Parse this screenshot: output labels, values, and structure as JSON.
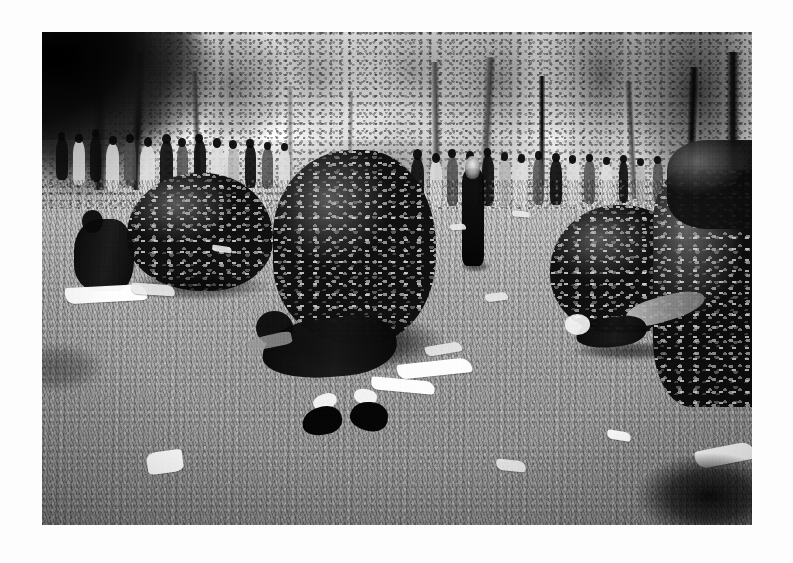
{
  "document": {
    "type": "photograph",
    "medium": "black-and-white gelatin silver print",
    "orientation": "landscape",
    "page_background_color": "#fdfdfd",
    "print_border_color": "#ffffff",
    "caption": ""
  },
  "photo": {
    "title": "Crowd gathered on park lawn with people resting beside shrubs",
    "tonality": "monochrome",
    "palette": {
      "sky_highlight": "#ffffff",
      "sky_midtone": "#e9e9e9",
      "lawn_light": "#c4c4c4",
      "lawn_mid": "#a2a2a2",
      "lawn_dark": "#8c8c8c",
      "foliage_dark": "#1a1a1a",
      "foliage_mid": "#5a5a5a",
      "figure_dark": "#141414",
      "paper_white": "#f8f8f8"
    },
    "frame": {
      "left": 42,
      "top": 32,
      "width": 710,
      "height": 493
    },
    "regions": [
      {
        "name": "sky",
        "description": "Overexposed white sky above the treeline",
        "tone": "highlight"
      },
      {
        "name": "treeline",
        "description": "Row of mature broadleaf trees across the upper third",
        "tone": "mid-dark"
      },
      {
        "name": "crowd",
        "description": "Dense crowd of standing people in the middle distance",
        "tone": "mixed"
      },
      {
        "name": "lawn",
        "description": "Open grass field filling the lower two thirds",
        "tone": "mid-light"
      },
      {
        "name": "shrubs",
        "description": "Three large leafy bushes arranged across the midground",
        "tone": "dark"
      },
      {
        "name": "resting-figures",
        "description": "People lying and sitting on the grass beside the bushes",
        "tone": "dark"
      },
      {
        "name": "litter",
        "description": "Scattered sheets of white paper and newspaper on the grass",
        "tone": "highlight"
      }
    ],
    "subjects": [
      {
        "id": "seated-figure-left",
        "description": "Person seated on grass beside the left bush, dark clothing, white cloth spread in front"
      },
      {
        "id": "reclining-figure-center",
        "description": "Person lying on grass in dark clothing with dark boots and white socks"
      },
      {
        "id": "reclining-figure-right",
        "description": "Person reclining beside the right hedge, light trousers, dark top"
      },
      {
        "id": "walking-figure",
        "description": "Figure with long light hair in dark clothing walking away from camera"
      },
      {
        "id": "background-crowd",
        "description": "Large crowd of standing and seated people along the treeline"
      }
    ]
  }
}
